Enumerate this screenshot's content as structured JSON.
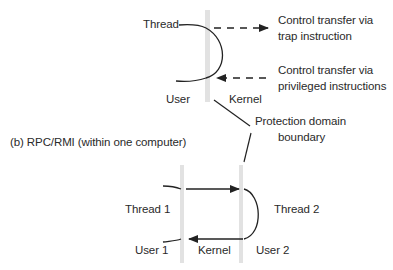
{
  "part_a": {
    "thread_label": "Thread",
    "user_label": "User",
    "kernel_label": "Kernel",
    "trap_annotation": [
      "Control transfer via",
      "trap instruction"
    ],
    "privileged_annotation": [
      "Control transfer via",
      "privileged instructions"
    ],
    "boundary_annotation": [
      "Protection domain",
      "boundary"
    ]
  },
  "part_b": {
    "caption": "(b) RPC/RMI (within one computer)",
    "thread1_label": "Thread 1",
    "thread2_label": "Thread 2",
    "user1_label": "User 1",
    "kernel_label": "Kernel",
    "user2_label": "User 2"
  },
  "colors": {
    "boundary_bar": "#e2e2e2",
    "line": "#222222",
    "text": "#2a2a2a"
  }
}
